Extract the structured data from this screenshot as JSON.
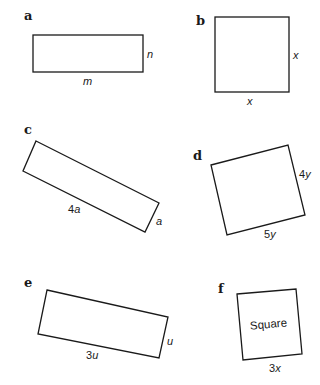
{
  "figure": {
    "panels": [
      {
        "id": "a",
        "letter": "a",
        "shape": "rectangle",
        "labels": {
          "side_right": "n",
          "side_bottom": "m"
        }
      },
      {
        "id": "b",
        "letter": "b",
        "shape": "square",
        "labels": {
          "side_right": "x",
          "side_bottom": "x"
        }
      },
      {
        "id": "c",
        "letter": "c",
        "shape": "rotated-rectangle",
        "labels": {
          "long_side_num": "4",
          "long_side_var": "a",
          "short_side": "a"
        }
      },
      {
        "id": "d",
        "letter": "d",
        "shape": "rotated-rectangle",
        "labels": {
          "right_side_num": "4",
          "right_side_var": "y",
          "bottom_side_num": "5",
          "bottom_side_var": "y"
        }
      },
      {
        "id": "e",
        "letter": "e",
        "shape": "rotated-rectangle",
        "labels": {
          "long_side_num": "3",
          "long_side_var": "u",
          "short_side": "u"
        }
      },
      {
        "id": "f",
        "letter": "f",
        "shape": "rotated-square",
        "labels": {
          "inner": "Square",
          "bottom_side_num": "3",
          "bottom_side_var": "x"
        }
      }
    ],
    "colors": {
      "stroke": "#1a1a1a",
      "background": "#ffffff"
    }
  }
}
